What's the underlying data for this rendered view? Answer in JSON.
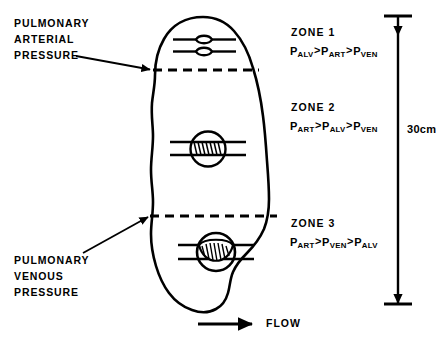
{
  "diagram": {
    "background_color": "#ffffff",
    "ink_color": "#000000"
  },
  "left_labels": {
    "arterial": {
      "line1": "PULMONARY",
      "line2": "ARTERIAL",
      "line3": "PRESSURE"
    },
    "venous": {
      "line1": "PULMONARY",
      "line2": "VENOUS",
      "line3": "PRESSURE"
    }
  },
  "zones": [
    {
      "name": "ZONE 1",
      "formula": {
        "t1": "P",
        "s1": "ALV",
        "op1": ">",
        "t2": "P",
        "s2": "ART",
        "op2": ">",
        "t3": "P",
        "s3": "VEN"
      },
      "capillary_state": "collapsed"
    },
    {
      "name": "ZONE 2",
      "formula": {
        "t1": "P",
        "s1": "ART",
        "op1": ">",
        "t2": "P",
        "s2": "ALV",
        "op2": ">",
        "t3": "P",
        "s3": "VEN"
      },
      "capillary_state": "partially-open"
    },
    {
      "name": "ZONE 3",
      "formula": {
        "t1": "P",
        "s1": "ART",
        "op1": ">",
        "t2": "P",
        "s2": "VEN",
        "op2": ">",
        "t3": "P",
        "s3": "ALV"
      },
      "capillary_state": "distended"
    }
  ],
  "dimension": {
    "value": "30",
    "unit": "cm",
    "label": "30cm"
  },
  "flow": {
    "label": "FLOW"
  }
}
